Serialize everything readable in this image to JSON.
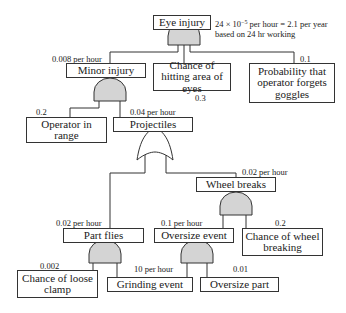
{
  "diagram": {
    "type": "fault-tree",
    "top_event": {
      "label": "Eye injury",
      "rate_note_line1_prefix": "24 × 10",
      "rate_note_exponent": "−5",
      "rate_note_line1_suffix": " per hour = 2.1 per year",
      "rate_note_line2": "based on 24 hr working",
      "gate": "AND"
    },
    "nodes": {
      "minor_injury": {
        "label": "Minor injury",
        "value": "0.008 per hour",
        "gate": "AND"
      },
      "chance_hitting_eyes": {
        "label": "Chance of hitting area of eyes",
        "value": "0.3"
      },
      "forgets_goggles": {
        "label": "Probability that operator forgets goggles",
        "value": "0.1"
      },
      "operator_in_range": {
        "label": "Operator in range",
        "value": "0.2"
      },
      "projectiles": {
        "label": "Projectiles",
        "value": "0.04 per hour",
        "gate": "OR"
      },
      "wheel_breaks": {
        "label": "Wheel breaks",
        "value": "0.02 per hour",
        "gate": "AND"
      },
      "part_flies": {
        "label": "Part flies",
        "value": "0.02 per hour",
        "gate": "AND"
      },
      "oversize_event": {
        "label": "Oversize event",
        "value": "0.1 per hour",
        "gate": "AND"
      },
      "chance_wheel_breaking": {
        "label": "Chance of wheel breaking",
        "value": "0.2"
      },
      "chance_loose_clamp": {
        "label": "Chance of loose clamp",
        "value": "0.002"
      },
      "grinding_event": {
        "label": "Grinding event",
        "value": "10 per hour"
      },
      "oversize_part": {
        "label": "Oversize part",
        "value": "0.01"
      }
    },
    "colors": {
      "gate_fill": "#d4d4d4",
      "line": "#333333",
      "box_border": "#333333"
    }
  }
}
